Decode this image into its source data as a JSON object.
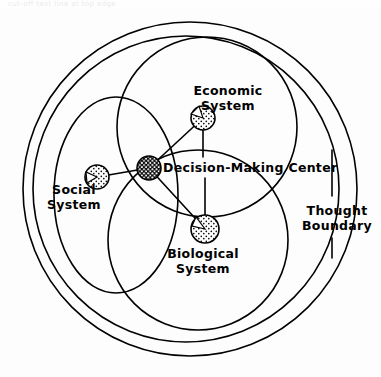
{
  "figure": {
    "kind": "venn-systems-diagram",
    "background": "#fdfdfd",
    "stroke_color": "#000000",
    "fill_color": "#ffffff",
    "width": 381,
    "height": 377
  },
  "header_artifact": {
    "text": "cut-off text line at top edge"
  },
  "labels": {
    "economic": {
      "line1": "Economic",
      "line2": "System"
    },
    "decision": {
      "line1": "Decision-Making Center"
    },
    "social": {
      "line1": "Social",
      "line2": "System"
    },
    "biological": {
      "line1": "Biological",
      "line2": "System"
    },
    "thought": {
      "line1": "Thought",
      "line2": "Boundary"
    }
  },
  "nodes": [
    {
      "name": "economic-system-node",
      "label": "Economic System",
      "cx": 203,
      "cy": 118,
      "r": 12,
      "fill": "stipple-light"
    },
    {
      "name": "decision-center-node",
      "label": "Decision-Making Center",
      "cx": 149,
      "cy": 168,
      "r": 12,
      "fill": "stipple-dark"
    },
    {
      "name": "social-system-node",
      "label": "Social System",
      "cx": 97,
      "cy": 177,
      "r": 12,
      "fill": "stipple-light"
    },
    {
      "name": "biological-system-node",
      "label": "Biological System",
      "cx": 205,
      "cy": 229,
      "r": 14,
      "fill": "stipple-light"
    }
  ],
  "connections": [
    {
      "from": "decision-center-node",
      "to": "economic-system-node"
    },
    {
      "from": "decision-center-node",
      "to": "social-system-node"
    },
    {
      "from": "decision-center-node",
      "to": "biological-system-node"
    }
  ],
  "boundaries": [
    {
      "name": "thought-boundary-outer",
      "shape": "circle",
      "cx": 190,
      "cy": 189,
      "r": 168
    },
    {
      "name": "thought-boundary-inner",
      "shape": "circle",
      "cx": 186,
      "cy": 189,
      "r": 154
    },
    {
      "name": "economic-system-region",
      "shape": "circle",
      "cx": 207,
      "cy": 127,
      "r": 90
    },
    {
      "name": "biological-system-region",
      "shape": "circle",
      "cx": 198,
      "cy": 240,
      "r": 90
    },
    {
      "name": "social-system-region",
      "shape": "ellipse",
      "cx": 116,
      "cy": 195,
      "rx": 62,
      "ry": 98
    }
  ]
}
